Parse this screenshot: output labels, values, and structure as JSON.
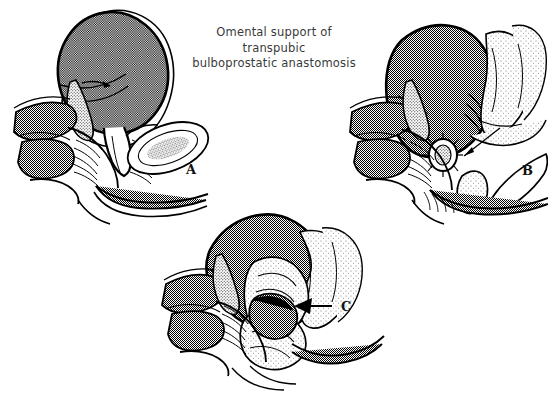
{
  "figure": {
    "title_lines": [
      "Omental support of",
      "transpubic",
      "bulboprostatic anastomosis"
    ],
    "title_color": "#3a3a3a",
    "background_color": "#ffffff",
    "ink_color": "#000000",
    "stipple_tone": "#9a9a9a",
    "canvas": {
      "width": 548,
      "height": 401
    }
  },
  "panels": [
    {
      "id": "A",
      "label": "A",
      "label_position": {
        "x": 186,
        "y": 162
      },
      "caption": "Distended bladder with intact prostate, pubic bone in section, rectum and urethra",
      "structures": [
        "bladder",
        "bladder-fold-arrow",
        "prostate",
        "pubic-bone-section",
        "rectum",
        "levator-muscle-hatching",
        "urethra",
        "seminal-vesicle"
      ]
    },
    {
      "id": "B",
      "label": "B",
      "label_position": {
        "x": 522,
        "y": 163
      },
      "caption": "Transpubic exposure with completed bulboprostatic anastomosis and mobilized omental flaps",
      "structures": [
        "bladder",
        "omental-flap",
        "anastomosis-ring",
        "anastomosis-arrow",
        "bulbar-urethra-stump",
        "retractor-blade",
        "rectum",
        "levator-muscle-hatching",
        "urethra"
      ]
    },
    {
      "id": "C",
      "label": "C",
      "label_position": {
        "x": 341,
        "y": 299
      },
      "caption": "Omentum wrapped around and supporting the completed anastomosis",
      "structures": [
        "bladder",
        "omental-wrap",
        "omentum-arrow",
        "anastomosis-site",
        "rectum",
        "levator-muscle-hatching",
        "urethra"
      ]
    }
  ]
}
